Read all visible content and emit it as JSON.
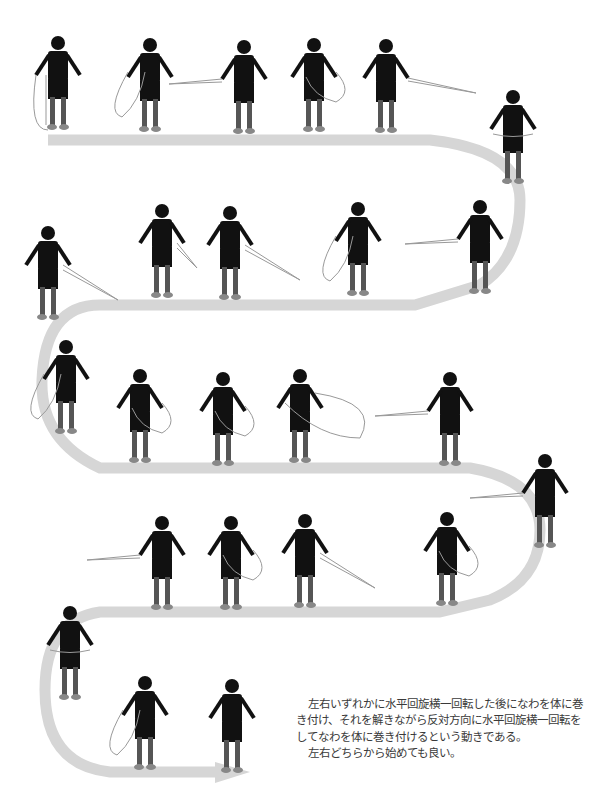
{
  "figure": {
    "title_cropped": "",
    "path_color": "#d6d6d6",
    "figure_color": "#111111",
    "rope_color": "#e8e8e8",
    "figures": [
      {
        "row": 1,
        "x": 58,
        "y": 130,
        "pose": "rope-vertical-both-sides"
      },
      {
        "row": 1,
        "x": 150,
        "y": 132,
        "pose": "rope-loop-left"
      },
      {
        "row": 1,
        "x": 244,
        "y": 134,
        "pose": "rope-horizontal-left"
      },
      {
        "row": 1,
        "x": 314,
        "y": 132,
        "pose": "rope-loop-right-walking"
      },
      {
        "row": 1,
        "x": 386,
        "y": 133,
        "pose": "rope-horizontal-right"
      },
      {
        "row": 1,
        "x": 513,
        "y": 184,
        "pose": "rope-wrapped-back"
      },
      {
        "row": 2,
        "x": 480,
        "y": 294,
        "pose": "rope-horizontal-left"
      },
      {
        "row": 2,
        "x": 358,
        "y": 296,
        "pose": "rope-loop-left-walking"
      },
      {
        "row": 2,
        "x": 230,
        "y": 300,
        "pose": "rope-diagonal-right"
      },
      {
        "row": 2,
        "x": 162,
        "y": 298,
        "pose": "rope-short-right"
      },
      {
        "row": 2,
        "x": 48,
        "y": 320,
        "pose": "rope-diagonal-right"
      },
      {
        "row": 3,
        "x": 66,
        "y": 434,
        "pose": "rope-loop-left"
      },
      {
        "row": 3,
        "x": 140,
        "y": 463,
        "pose": "rope-loop-right"
      },
      {
        "row": 3,
        "x": 223,
        "y": 466,
        "pose": "rope-loop-right"
      },
      {
        "row": 3,
        "x": 300,
        "y": 463,
        "pose": "rope-big-loop-right"
      },
      {
        "row": 3,
        "x": 450,
        "y": 466,
        "pose": "rope-horizontal-left"
      },
      {
        "row": 3,
        "x": 545,
        "y": 548,
        "pose": "rope-horizontal-left-walking"
      },
      {
        "row": 4,
        "x": 447,
        "y": 606,
        "pose": "rope-loop-right-back"
      },
      {
        "row": 4,
        "x": 305,
        "y": 608,
        "pose": "rope-diagonal-right-walking"
      },
      {
        "row": 4,
        "x": 231,
        "y": 610,
        "pose": "rope-loop-both"
      },
      {
        "row": 4,
        "x": 162,
        "y": 610,
        "pose": "rope-horizontal-left"
      },
      {
        "row": 4,
        "x": 70,
        "y": 700,
        "pose": "rope-wrapped-front"
      },
      {
        "row": 5,
        "x": 145,
        "y": 770,
        "pose": "rope-loop-left-front"
      },
      {
        "row": 5,
        "x": 232,
        "y": 773,
        "pose": "standing-front"
      }
    ]
  },
  "description": {
    "paragraph_1": "左右いずれかに水平回旋横一回転した後になわを体に巻き付け、それを解きながら反対方向に水平回旋横一回転をしてなわを体に巻き付けるという動きである。",
    "paragraph_2": "左右どちらから始めても良い。"
  }
}
